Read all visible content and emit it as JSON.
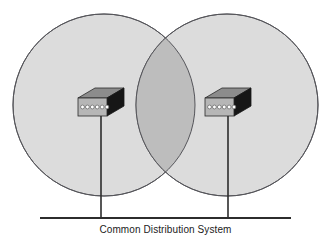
{
  "figure": {
    "type": "network-coverage-diagram",
    "caption": "Common Distribution System",
    "background_color": "#ffffff",
    "cells": [
      {
        "name": "left-coverage-cell",
        "cx": 104,
        "cy": 105,
        "r": 91,
        "fill": "#dcdcdc",
        "stroke": "#55555a"
      },
      {
        "name": "right-coverage-cell",
        "cx": 227,
        "cy": 105,
        "r": 91,
        "fill": "#dcdcdc",
        "stroke": "#55555a"
      }
    ],
    "overlap": {
      "name": "coverage-overlap-region",
      "fill": "#bdbdbd",
      "stroke": "#55555a"
    },
    "devices": [
      {
        "name": "left-access-point",
        "label": "",
        "x": 78,
        "y": 88,
        "width": 46,
        "height": 28,
        "port_count": 6,
        "top_fill": "#8c8c8c",
        "front_fill": "#b6b6b6",
        "side_fill": "#161616",
        "port_fill": "#ffffff",
        "outline": "#2a2a2a"
      },
      {
        "name": "right-access-point",
        "label": "",
        "x": 201,
        "y": 88,
        "width": 46,
        "height": 28,
        "port_count": 6,
        "top_fill": "#8c8c8c",
        "front_fill": "#b6b6b6",
        "side_fill": "#161616",
        "port_fill": "#ffffff",
        "outline": "#2a2a2a"
      }
    ],
    "connectors": [
      {
        "name": "left-drop-cable",
        "x": 101,
        "y1": 112,
        "y2": 218,
        "color": "#2c2c2c"
      },
      {
        "name": "right-drop-cable",
        "x": 228,
        "y1": 112,
        "y2": 218,
        "color": "#2c2c2c"
      }
    ],
    "bus": {
      "name": "common-distribution-bus",
      "x1": 40,
      "x2": 291,
      "y": 218,
      "color": "#2c2c2c",
      "thickness": 2
    }
  }
}
